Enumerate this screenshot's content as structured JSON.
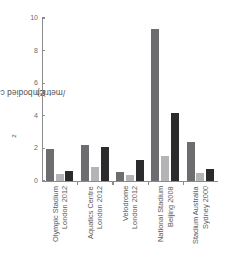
{
  "chart_data": {
    "type": "bar",
    "title": "",
    "subtitle": "",
    "xlabel": "",
    "ylabel": "Embodied carbon (t CO2/metric)",
    "ylabel_prefix": "Embodied carbon (t CO",
    "ylabel_sub": "2",
    "ylabel_suffix": "/metric)",
    "ylim": [
      0,
      10
    ],
    "yticks": [
      0,
      2,
      4,
      6,
      8,
      10
    ],
    "ytick_labels": [
      "0",
      "2",
      "4",
      "6",
      "8",
      "10"
    ],
    "grid": false,
    "legend": "none",
    "categories": [
      "Olympic Stadium London 2012",
      "Aquatics Centre London 2012",
      "Velodrome London 2012",
      "National Stadium Beijing 2008",
      "Stadium Australia Sydney 2000"
    ],
    "category_lines": [
      [
        "Olympic Stadium",
        "London 2012"
      ],
      [
        "Aquatics Centre",
        "London 2012"
      ],
      [
        "Velodrome",
        "London 2012"
      ],
      [
        "National Stadium",
        "Beijing 2008"
      ],
      [
        "Stadium Australia",
        "Sydney 2000"
      ]
    ],
    "series": [
      {
        "name": "series-1",
        "color": "#6d6d6f",
        "values": [
          1.95,
          2.2,
          0.55,
          9.35,
          2.4
        ]
      },
      {
        "name": "series-2",
        "color": "#b4b4b6",
        "values": [
          0.45,
          0.85,
          0.35,
          1.5,
          0.5
        ]
      },
      {
        "name": "series-3",
        "color": "#2b2b2d",
        "values": [
          0.58,
          2.1,
          1.25,
          4.15,
          0.72
        ]
      }
    ],
    "colors": {
      "axis": "#8b8b8d",
      "text": "#5a5a5c",
      "background": "#ffffff"
    }
  }
}
